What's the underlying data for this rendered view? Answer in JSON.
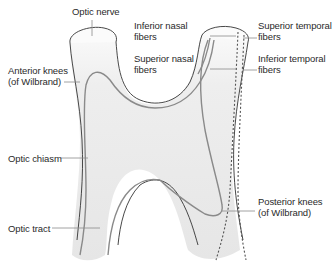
{
  "diagram": {
    "colors": {
      "background": "#ffffff",
      "structure_fill": "#ececec",
      "structure_highlight": "#fafafa",
      "outline": "#333333",
      "nasal_fiber": "#8a8a8a",
      "temporal_fiber": "#555555",
      "leader_line": "#8a8a8a",
      "text": "#2a2a2a"
    },
    "labels": {
      "optic_nerve": "Optic nerve",
      "inferior_nasal": "Inferior nasal\nfibers",
      "superior_nasal": "Superior nasal\nfibers",
      "superior_temporal": "Superior temporal\nfibers",
      "inferior_temporal": "Inferior temporal\nfibers",
      "anterior_knees": "Anterior knees\n(of Wilbrand)",
      "optic_chiasm": "Optic chiasm",
      "optic_tract": "Optic tract",
      "posterior_knees": "Posterior knees\n(of Wilbrand)"
    }
  }
}
